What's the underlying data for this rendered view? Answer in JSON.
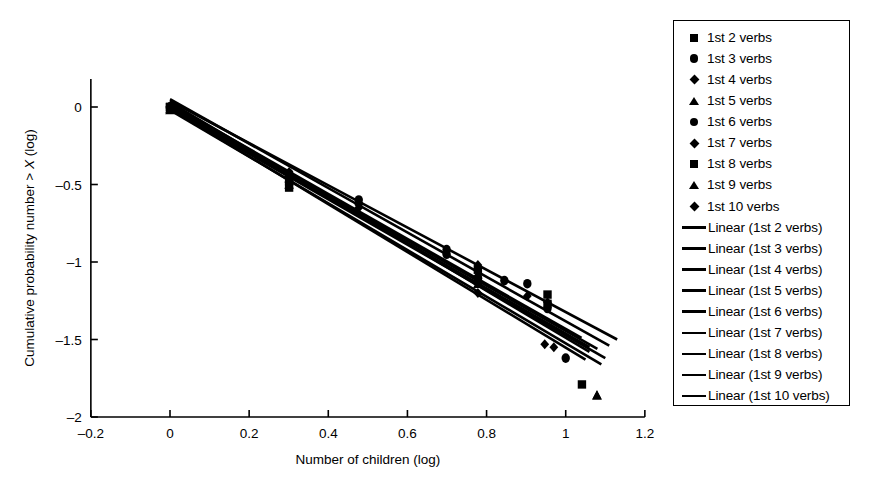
{
  "chart_data": {
    "type": "scatter",
    "title": "",
    "xlabel": "Number of children (log)",
    "ylabel": "Cumulative probability number > X (log)",
    "xlim": [
      -0.2,
      1.2
    ],
    "ylim": [
      -2,
      0.15
    ],
    "xticks": [
      "-0.2",
      "0",
      "0.2",
      "0.4",
      "0.6",
      "0.8",
      "1",
      "1.2"
    ],
    "xtick_values": [
      -0.2,
      0,
      0.2,
      0.4,
      0.6,
      0.8,
      1.0,
      1.2
    ],
    "yticks": [
      "0",
      "-0.5",
      "-1",
      "-1.5",
      "-2"
    ],
    "ytick_values": [
      0,
      -0.5,
      -1,
      -1.5,
      -2
    ],
    "grid": false,
    "legend_position": "right-outside",
    "color": "#000000",
    "series": [
      {
        "name": "1st 2 verbs",
        "marker": "square",
        "points": [
          {
            "x": 0.0,
            "y": 0.0
          },
          {
            "x": 0.301,
            "y": -0.52
          },
          {
            "x": 0.778,
            "y": -1.12
          },
          {
            "x": 0.954,
            "y": -1.27
          },
          {
            "x": 1.041,
            "y": -1.79
          }
        ],
        "fit": {
          "label": "Linear (1st 2 verbs)",
          "x0": 0.0,
          "y0": 0.04,
          "x1": 1.13,
          "y1": -1.5
        }
      },
      {
        "name": "1st 3 verbs",
        "marker": "circle",
        "points": [
          {
            "x": 0.0,
            "y": 0.0
          },
          {
            "x": 0.301,
            "y": -0.44
          },
          {
            "x": 0.477,
            "y": -0.6
          },
          {
            "x": 0.699,
            "y": -0.92
          },
          {
            "x": 0.903,
            "y": -1.14
          },
          {
            "x": 1.0,
            "y": -1.62
          }
        ],
        "fit": {
          "label": "Linear (1st 3 verbs)",
          "x0": 0.0,
          "y0": 0.05,
          "x1": 1.11,
          "y1": -1.54
        }
      },
      {
        "name": "1st 4 verbs",
        "marker": "diamond",
        "points": [
          {
            "x": 0.0,
            "y": 0.0
          },
          {
            "x": 0.301,
            "y": -0.42
          },
          {
            "x": 0.477,
            "y": -0.62
          },
          {
            "x": 0.778,
            "y": -1.02
          },
          {
            "x": 0.954,
            "y": -1.26
          },
          {
            "x": 0.97,
            "y": -1.55
          }
        ],
        "fit": {
          "label": "Linear (1st 4 verbs)",
          "x0": 0.0,
          "y0": 0.03,
          "x1": 1.06,
          "y1": -1.58
        }
      },
      {
        "name": "1st 5 verbs",
        "marker": "triangle",
        "points": [
          {
            "x": 0.0,
            "y": -0.01
          },
          {
            "x": 0.301,
            "y": -0.46
          },
          {
            "x": 0.778,
            "y": -1.08
          },
          {
            "x": 1.079,
            "y": -1.86
          }
        ],
        "fit": {
          "label": "Linear (1st 5 verbs)",
          "x0": 0.0,
          "y0": -0.01,
          "x1": 1.1,
          "y1": -1.62
        }
      },
      {
        "name": "1st 6 verbs",
        "marker": "circle",
        "points": [
          {
            "x": 0.0,
            "y": 0.0
          },
          {
            "x": 0.301,
            "y": -0.43
          },
          {
            "x": 0.699,
            "y": -0.95
          },
          {
            "x": 0.845,
            "y": -1.12
          },
          {
            "x": 0.954,
            "y": -1.3
          }
        ],
        "fit": {
          "label": "Linear (1st 6 verbs)",
          "x0": 0.0,
          "y0": 0.02,
          "x1": 1.04,
          "y1": -1.49
        }
      },
      {
        "name": "1st 7 verbs",
        "marker": "diamond",
        "points": [
          {
            "x": 0.0,
            "y": 0.0
          },
          {
            "x": 0.301,
            "y": -0.44
          },
          {
            "x": 0.477,
            "y": -0.63
          },
          {
            "x": 0.778,
            "y": -1.09
          },
          {
            "x": 0.903,
            "y": -1.22
          }
        ],
        "fit": {
          "label": "Linear (1st 7 verbs)",
          "x0": 0.0,
          "y0": 0.0,
          "x1": 1.06,
          "y1": -1.55
        }
      },
      {
        "name": "1st 8 verbs",
        "marker": "square",
        "points": [
          {
            "x": 0.0,
            "y": 0.0
          },
          {
            "x": 0.301,
            "y": -0.48
          },
          {
            "x": 0.778,
            "y": -1.05
          },
          {
            "x": 0.954,
            "y": -1.21
          }
        ],
        "fit": {
          "label": "Linear (1st 8 verbs)",
          "x0": 0.0,
          "y0": 0.01,
          "x1": 1.08,
          "y1": -1.56
        }
      },
      {
        "name": "1st 9 verbs",
        "marker": "triangle",
        "points": [
          {
            "x": 0.0,
            "y": -0.02
          },
          {
            "x": 0.301,
            "y": -0.5
          },
          {
            "x": 0.778,
            "y": -1.14
          },
          {
            "x": 1.079,
            "y": -1.86
          }
        ],
        "fit": {
          "label": "Linear (1st 9 verbs)",
          "x0": 0.0,
          "y0": -0.02,
          "x1": 1.09,
          "y1": -1.66
        }
      },
      {
        "name": "1st 10 verbs",
        "marker": "diamond",
        "points": [
          {
            "x": 0.0,
            "y": -0.01
          },
          {
            "x": 0.301,
            "y": -0.45
          },
          {
            "x": 0.477,
            "y": -0.65
          },
          {
            "x": 0.778,
            "y": -1.2
          },
          {
            "x": 0.947,
            "y": -1.53
          }
        ],
        "fit": {
          "label": "Linear (1st 10 verbs)",
          "x0": 0.0,
          "y0": -0.01,
          "x1": 1.05,
          "y1": -1.63
        }
      }
    ]
  },
  "legend": {
    "marker_entries": [
      {
        "label": "1st 2 verbs",
        "marker": "square"
      },
      {
        "label": "1st 3 verbs",
        "marker": "circle"
      },
      {
        "label": "1st 4 verbs",
        "marker": "diamond"
      },
      {
        "label": "1st 5 verbs",
        "marker": "triangle"
      },
      {
        "label": "1st 6 verbs",
        "marker": "circle"
      },
      {
        "label": "1st 7 verbs",
        "marker": "diamond"
      },
      {
        "label": "1st 8 verbs",
        "marker": "square"
      },
      {
        "label": "1st 9 verbs",
        "marker": "triangle"
      },
      {
        "label": "1st 10 verbs",
        "marker": "diamond"
      }
    ],
    "line_entries": [
      {
        "label": "Linear (1st 2 verbs)"
      },
      {
        "label": "Linear (1st 3 verbs)"
      },
      {
        "label": "Linear (1st 4 verbs)"
      },
      {
        "label": "Linear (1st 5 verbs)"
      },
      {
        "label": "Linear (1st 6 verbs)"
      },
      {
        "label": "Linear (1st 7 verbs)"
      },
      {
        "label": "Linear (1st 8 verbs)"
      },
      {
        "label": "Linear (1st 9 verbs)"
      },
      {
        "label": "Linear (1st 10 verbs)"
      }
    ]
  }
}
